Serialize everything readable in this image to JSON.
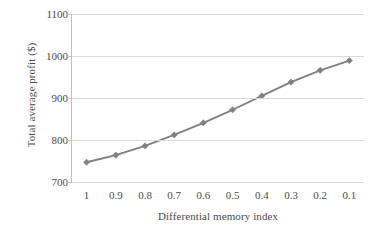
{
  "chart_data": {
    "type": "line",
    "title": "",
    "xlabel": "Differential memory index",
    "ylabel": "Total average profit ($)",
    "categories": [
      "1",
      "0.9",
      "0.8",
      "0.7",
      "0.6",
      "0.5",
      "0.4",
      "0.3",
      "0.2",
      "0.1"
    ],
    "values": [
      747,
      764,
      786,
      812,
      841,
      872,
      905,
      938,
      966,
      989
    ],
    "series": [
      {
        "name": "Total average profit",
        "values": [
          747,
          764,
          786,
          812,
          841,
          872,
          905,
          938,
          966,
          989
        ]
      }
    ],
    "ylim": [
      700,
      1100
    ],
    "yticks": [
      700,
      800,
      900,
      1000,
      1100
    ],
    "ytick_labels": [
      "700",
      "800",
      "900",
      "1000",
      "1100"
    ],
    "grid": true,
    "legend": false,
    "legend_position": "none",
    "marker": "diamond",
    "line_color": "#808080",
    "marker_color": "#808080",
    "grid_color": "#d9d9d9",
    "axis_color": "#bfbfbf",
    "background_color": "#ffffff",
    "text_color": "#4a4a4a"
  }
}
